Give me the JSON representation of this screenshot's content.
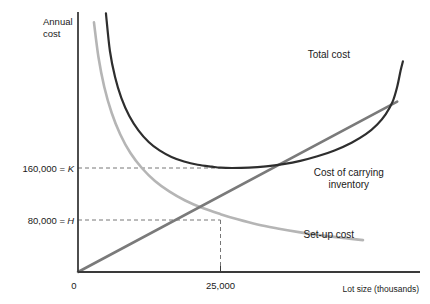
{
  "chart_data": {
    "type": "line",
    "title": "",
    "xlabel": "Lot size (thousands)",
    "ylabel": "Annual cost",
    "xlim": [
      0,
      60000
    ],
    "ylim": [
      0,
      400000
    ],
    "grid": false,
    "legend_position": "inline-annotations",
    "x_ticks": [
      {
        "value": 0,
        "label": "0"
      },
      {
        "value": 25000,
        "label": "25,000"
      }
    ],
    "y_ticks": [
      {
        "value": 160000,
        "label": "160,000 = ",
        "symbol": "K"
      },
      {
        "value": 80000,
        "label": "80,000 = ",
        "symbol": "H"
      }
    ],
    "annotations": [
      {
        "name": "total-cost-label",
        "text": "Total cost",
        "x": 44000,
        "y": 330000
      },
      {
        "name": "carrying-cost-label",
        "text": "Cost of carrying",
        "x": 47500,
        "y": 148000
      },
      {
        "name": "carrying-cost-label-line2",
        "text": "inventory",
        "x": 47500,
        "y": 130000
      },
      {
        "name": "setup-cost-label",
        "text": "Set-up cost",
        "x": 44000,
        "y": 52000
      }
    ],
    "guide_lines": [
      {
        "name": "k-guide",
        "orientation": "horizontal",
        "value": 160000,
        "style": "dashed"
      },
      {
        "name": "h-guide",
        "orientation": "horizontal",
        "value": 80000,
        "style": "dashed"
      },
      {
        "name": "eoq-guide",
        "orientation": "vertical",
        "value": 25000,
        "style": "dashed"
      }
    ],
    "series": [
      {
        "name": "Total cost",
        "color": "#2e2e2e",
        "width": 2.2,
        "points": [
          [
            4900,
            398000
          ],
          [
            5600,
            340000
          ],
          [
            6500,
            300000
          ],
          [
            7600,
            268000
          ],
          [
            9000,
            240000
          ],
          [
            10600,
            218000
          ],
          [
            12400,
            200000
          ],
          [
            14300,
            187000
          ],
          [
            16400,
            177000
          ],
          [
            18600,
            170000
          ],
          [
            21000,
            165000
          ],
          [
            23500,
            162000
          ],
          [
            25000,
            160500
          ],
          [
            27000,
            160000
          ],
          [
            30000,
            160500
          ],
          [
            33000,
            162500
          ],
          [
            36000,
            166000
          ],
          [
            39000,
            171000
          ],
          [
            42000,
            178000
          ],
          [
            45000,
            187000
          ],
          [
            48000,
            199000
          ],
          [
            50500,
            212000
          ],
          [
            52500,
            227000
          ],
          [
            54000,
            243000
          ],
          [
            55200,
            262000
          ],
          [
            56000,
            285000
          ],
          [
            56600,
            310000
          ],
          [
            57000,
            324000
          ]
        ]
      },
      {
        "name": "Set-up cost",
        "color": "#b5b5b5",
        "width": 2.6,
        "points": [
          [
            2800,
            384000
          ],
          [
            3600,
            330000
          ],
          [
            4600,
            285000
          ],
          [
            5900,
            245000
          ],
          [
            7400,
            212000
          ],
          [
            9200,
            183000
          ],
          [
            11200,
            160000
          ],
          [
            13500,
            140000
          ],
          [
            16000,
            124000
          ],
          [
            18800,
            110000
          ],
          [
            22000,
            98000
          ],
          [
            25000,
            89000
          ],
          [
            28000,
            81000
          ],
          [
            31500,
            73000
          ],
          [
            35000,
            67000
          ],
          [
            39000,
            61000
          ],
          [
            43000,
            56000
          ],
          [
            47000,
            52000
          ],
          [
            50000,
            49000
          ]
        ]
      },
      {
        "name": "Cost of carrying inventory",
        "color": "#7a7a7a",
        "width": 2.6,
        "points": [
          [
            0,
            0
          ],
          [
            56000,
            262000
          ]
        ]
      }
    ]
  },
  "axes": {
    "y_axis_title_line1": "Annual",
    "y_axis_title_line2": "cost",
    "x_axis_title": "Lot size (thousands)",
    "origin_label": "0"
  },
  "colors": {
    "total_cost": "#2e2e2e",
    "setup_cost": "#b5b5b5",
    "carrying_cost": "#7a7a7a",
    "axis": "#3a3a3a",
    "guide": "#777777",
    "text": "#1a1a1a",
    "background": "#ffffff"
  }
}
